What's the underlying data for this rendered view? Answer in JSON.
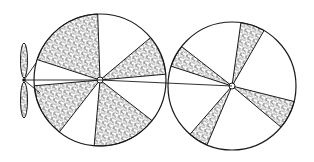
{
  "figure": {
    "type": "line-art diagram",
    "width": 314,
    "height": 162,
    "colors": {
      "ink": "#1a1a1a",
      "paper": "#ffffff",
      "stipple": "#333333"
    }
  },
  "propeller": {
    "hub": {
      "x": 24,
      "y": 80
    },
    "blade_top": {
      "y1": 43,
      "y2": 78,
      "half_width": 3.5
    },
    "blade_bottom": {
      "y1": 82,
      "y2": 118,
      "half_width": 3.5
    },
    "tension_lines": [
      {
        "x1": 24,
        "y1": 80,
        "x2": 36,
        "y2": 63
      },
      {
        "x1": 24,
        "y1": 80,
        "x2": 100,
        "y2": 80
      },
      {
        "x1": 24,
        "y1": 80,
        "x2": 40,
        "y2": 93
      }
    ]
  },
  "disks": [
    {
      "name": "left-disk",
      "cx": 100,
      "cy": 80,
      "r": 66,
      "shaded_wedges": [
        {
          "start": 198,
          "end": 268
        },
        {
          "start": 320,
          "end": 355
        },
        {
          "start": 128,
          "end": 175
        },
        {
          "start": 38,
          "end": 95
        }
      ]
    },
    {
      "name": "right-disk",
      "cx": 232,
      "cy": 86,
      "r": 64,
      "shaded_wedges": [
        {
          "start": 198,
          "end": 218
        },
        {
          "start": 278,
          "end": 300
        },
        {
          "start": 14,
          "end": 40
        },
        {
          "start": 113,
          "end": 131
        }
      ]
    }
  ],
  "connector": {
    "x1": 100,
    "y1": 80,
    "x2": 232,
    "y2": 86
  }
}
